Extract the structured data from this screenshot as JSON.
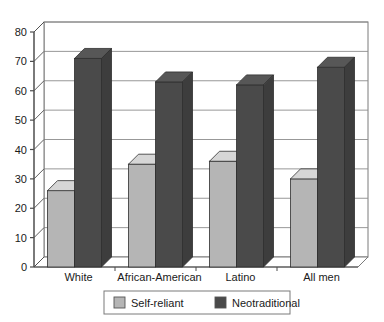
{
  "chart_data": {
    "type": "bar",
    "title": "",
    "subtitle": "",
    "xlabel": "",
    "ylabel": "",
    "categories": [
      "White",
      "African-American",
      "Latino",
      "All men"
    ],
    "series": [
      {
        "name": "Self-reliant",
        "values": [
          26,
          35,
          36,
          30
        ],
        "color": "#b5b5b5"
      },
      {
        "name": "Neotraditional",
        "values": [
          71,
          63,
          62,
          68
        ],
        "color": "#4a4a4a"
      }
    ],
    "ylim": [
      0,
      80
    ],
    "yticks": [
      0,
      10,
      20,
      30,
      40,
      50,
      60,
      70,
      80
    ],
    "ytick_labels": [
      "0",
      "10",
      "20",
      "30",
      "40",
      "50",
      "60",
      "70",
      "80"
    ],
    "grid": true,
    "grid_axis": "y",
    "legend_position": "bottom",
    "style": "3d-bar",
    "colors": {
      "self_reliant": "#b5b5b5",
      "neotraditional": "#4a4a4a",
      "axis": "#4d4d4d",
      "grid": "#8c8c8c",
      "background": "#ffffff",
      "text": "#1a1a1a"
    }
  },
  "legend": {
    "items": [
      {
        "label": "Self-reliant",
        "swatch": "#b5b5b5"
      },
      {
        "label": "Neotraditional",
        "swatch": "#4a4a4a"
      }
    ]
  }
}
